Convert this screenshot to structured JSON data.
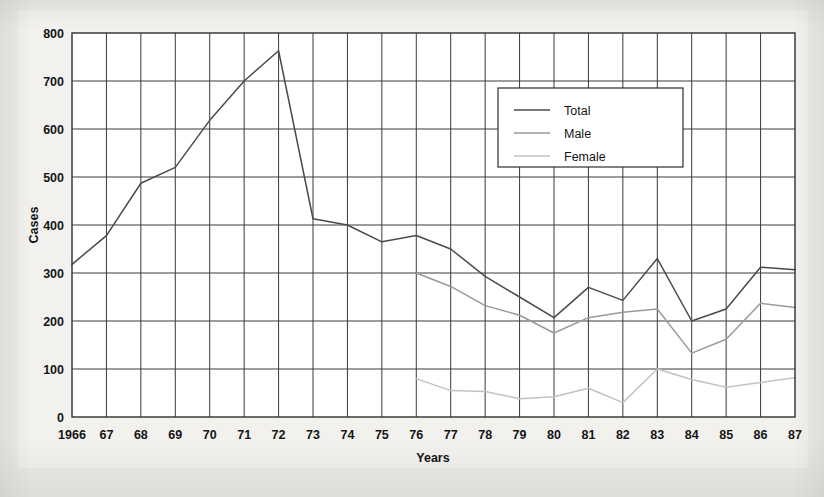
{
  "figure": {
    "background_color": "#f2f1ee",
    "page_color": "#eceae6"
  },
  "chart_data": {
    "type": "line",
    "title": "",
    "xlabel": "Years",
    "ylabel": "Cases",
    "x": [
      1966,
      1967,
      1968,
      1969,
      1970,
      1971,
      1972,
      1973,
      1974,
      1975,
      1976,
      1977,
      1978,
      1979,
      1980,
      1981,
      1982,
      1983,
      1984,
      1985,
      1986,
      1987
    ],
    "categories": [
      "1966",
      "67",
      "68",
      "69",
      "70",
      "71",
      "72",
      "73",
      "74",
      "75",
      "76",
      "77",
      "78",
      "79",
      "80",
      "81",
      "82",
      "83",
      "84",
      "85",
      "86",
      "87"
    ],
    "xlim": [
      1966,
      1987
    ],
    "ylim": [
      0,
      800
    ],
    "yticks": [
      0,
      100,
      200,
      300,
      400,
      500,
      600,
      700,
      800
    ],
    "ytick_labels": [
      "0",
      "100",
      "200",
      "300",
      "400",
      "500",
      "600",
      "700",
      "800"
    ],
    "grid": true,
    "grid_color": "#3a3a3a",
    "legend_position": "upper-right",
    "series": [
      {
        "name": "Total",
        "color": "#4a4a4a",
        "values": [
          318,
          378,
          487,
          520,
          618,
          700,
          763,
          413,
          400,
          365,
          378,
          350,
          293,
          250,
          207,
          270,
          243,
          330,
          200,
          225,
          312,
          307
        ]
      },
      {
        "name": "Male",
        "color": "#9a9a9a",
        "values": [
          null,
          null,
          null,
          null,
          null,
          null,
          null,
          null,
          null,
          null,
          300,
          272,
          232,
          212,
          175,
          207,
          218,
          225,
          133,
          162,
          237,
          228
        ]
      },
      {
        "name": "Female",
        "color": "#c2c2c2",
        "values": [
          null,
          null,
          null,
          null,
          null,
          null,
          null,
          null,
          null,
          null,
          80,
          55,
          53,
          38,
          42,
          60,
          30,
          100,
          78,
          62,
          72,
          82
        ]
      }
    ]
  },
  "legend": {
    "items": [
      {
        "label": "Total"
      },
      {
        "label": "Male"
      },
      {
        "label": "Female"
      }
    ]
  }
}
